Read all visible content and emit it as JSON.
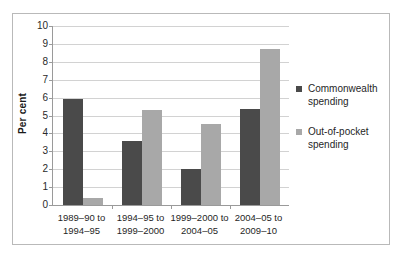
{
  "chart_data": {
    "type": "bar",
    "title": "",
    "subtitle": "",
    "xlabel": "",
    "ylabel": "Per cent",
    "ylim": [
      0,
      10
    ],
    "ytick_step": 1,
    "yticks": [
      "10",
      "9",
      "8",
      "7",
      "6",
      "5",
      "4",
      "3",
      "2",
      "1",
      "0"
    ],
    "grid": true,
    "legend_position": "right",
    "categories": [
      "1989–90 to 1994–95",
      "1994–95 to 1999–2000",
      "1999–2000 to 2004–05",
      "2004–05 to 2009–10"
    ],
    "categories_lines": [
      [
        "1989–90 to",
        "1994–95"
      ],
      [
        "1994–95 to",
        "1999–2000"
      ],
      [
        "1999–2000 to",
        "2004–05"
      ],
      [
        "2004–05 to",
        "2009–10"
      ]
    ],
    "series": [
      {
        "name": "Commonwealth spending",
        "name_lines": [
          "Commonwealth",
          "spending"
        ],
        "color": "#4a4a4a",
        "values": [
          5.9,
          3.6,
          2.0,
          5.35
        ]
      },
      {
        "name": "Out-of-pocket spending",
        "name_lines": [
          "Out-of-pocket",
          "spending"
        ],
        "color": "#a8a8a8",
        "values": [
          0.4,
          5.3,
          4.55,
          8.7
        ]
      }
    ]
  },
  "colors": {
    "commonwealth": "#4a4a4a",
    "out_of_pocket": "#a8a8a8",
    "gridline": "#d2d2d2",
    "axis": "#9a9a9a",
    "frame": "#b9b9b9",
    "text": "#1f1f1f"
  }
}
